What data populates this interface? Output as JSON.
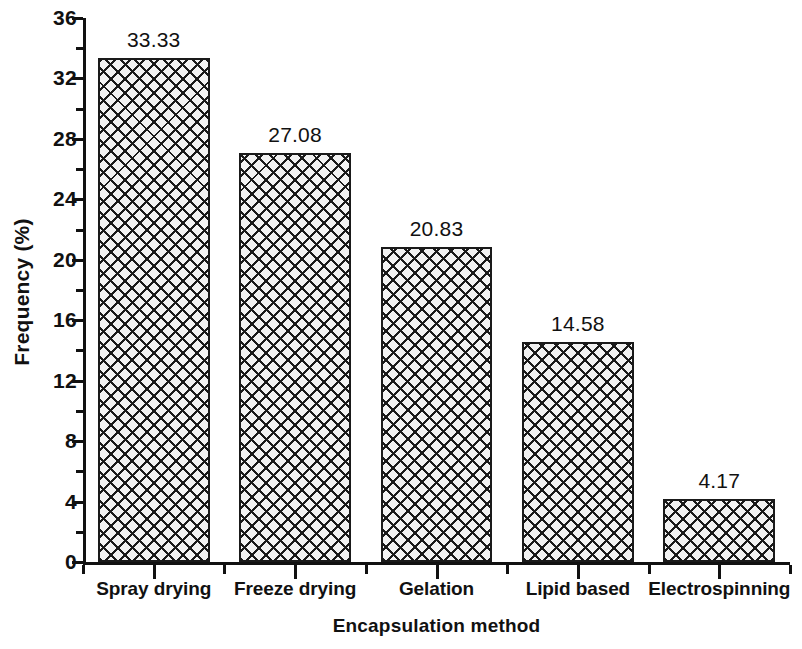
{
  "chart_data": {
    "type": "bar",
    "title": "",
    "xlabel": "Encapsulation method",
    "ylabel": "Frequency (%)",
    "categories": [
      "Spray drying",
      "Freeze drying",
      "Gelation",
      "Lipid based",
      "Electrospinning"
    ],
    "values": [
      33.33,
      27.08,
      20.83,
      14.58,
      4.17
    ],
    "value_labels": [
      "33.33",
      "27.08",
      "20.83",
      "14.58",
      "4.17"
    ],
    "ylim": [
      0,
      36
    ],
    "ytick_step": 4,
    "yticks": [
      0,
      4,
      8,
      12,
      16,
      20,
      24,
      28,
      32,
      36
    ],
    "ytick_labels": [
      "0",
      "4",
      "8",
      "12",
      "16",
      "20",
      "24",
      "28",
      "32",
      "36"
    ],
    "minor_tick_step": 2,
    "grid": false,
    "legend": null,
    "bar_fill": "crosshatch",
    "bar_color": "#f2f2f2",
    "bar_edge_color": "#1a1a1a",
    "axis_color": "#111111"
  }
}
